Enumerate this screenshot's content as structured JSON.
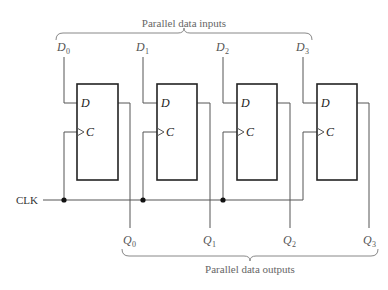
{
  "diagram": {
    "title_inputs": "Parallel data inputs",
    "title_outputs": "Parallel data outputs",
    "clock_label": "CLK",
    "flip_flops": [
      {
        "input_label": "D",
        "input_sub": "0",
        "output_label": "Q",
        "output_sub": "0",
        "pin_d": "D",
        "pin_c": "C"
      },
      {
        "input_label": "D",
        "input_sub": "1",
        "output_label": "Q",
        "output_sub": "1",
        "pin_d": "D",
        "pin_c": "C"
      },
      {
        "input_label": "D",
        "input_sub": "2",
        "output_label": "Q",
        "output_sub": "2",
        "pin_d": "D",
        "pin_c": "C"
      },
      {
        "input_label": "D",
        "input_sub": "3",
        "output_label": "Q",
        "output_sub": "3",
        "pin_d": "D",
        "pin_c": "C"
      }
    ],
    "colors": {
      "wire": "#555555",
      "box": "#222222",
      "junction": "#111111",
      "text": "#555555"
    }
  }
}
